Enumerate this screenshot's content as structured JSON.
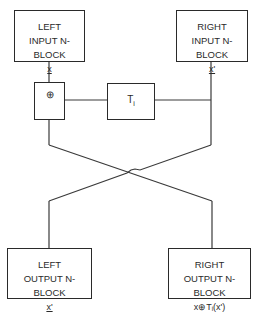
{
  "diagram": {
    "blocks": {
      "left_input": {
        "line1": "LEFT",
        "line2": "INPUT N-BLOCK",
        "var": "x"
      },
      "right_input": {
        "line1": "RIGHT",
        "line2": "INPUT N- BLOCK",
        "var": "x'"
      },
      "left_output": {
        "line1": "LEFT",
        "line2": "OUTPUT N-BLOCK",
        "var": "x'"
      },
      "right_output": {
        "line1": "RIGHT",
        "line2": "OUTPUT N-BLOCK",
        "var": "x⊕Tᵢ(x')"
      }
    },
    "operators": {
      "xor": {
        "symbol": "⊕"
      },
      "transform": {
        "label": "T",
        "sub": "i"
      }
    },
    "colors": {
      "line": "#2a2a2a",
      "background": "#ffffff"
    }
  }
}
